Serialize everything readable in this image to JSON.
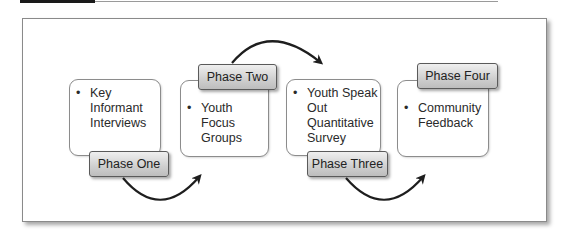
{
  "diagram": {
    "phases": [
      {
        "label": "Phase One",
        "items": [
          "Key Informant Interviews"
        ]
      },
      {
        "label": "Phase Two",
        "items": [
          "Youth Focus Groups"
        ]
      },
      {
        "label": "Phase Three",
        "items": [
          "Youth Speak Out Quantitative Survey"
        ]
      },
      {
        "label": "Phase Four",
        "items": [
          "Community Feedback"
        ]
      }
    ],
    "lines": {
      "box1": [
        "Key",
        "Informant",
        "Interviews"
      ],
      "box2": [
        "Youth Focus",
        "Groups"
      ],
      "box3": [
        "Youth Speak",
        "Out",
        "Quantitative",
        "Survey"
      ],
      "box4": [
        "Community",
        "Feedback"
      ]
    },
    "arrow_color": "#1e1e1e"
  }
}
